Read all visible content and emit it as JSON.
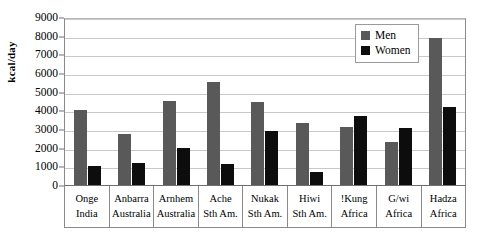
{
  "chart_data": {
    "type": "bar",
    "title": "",
    "xlabel": "",
    "ylabel": "kcal/day",
    "ylim": [
      0,
      9000
    ],
    "yticks": [
      9000,
      8000,
      7000,
      6000,
      5000,
      4000,
      3000,
      2000,
      1000,
      0
    ],
    "grid": true,
    "legend_position": "top-right",
    "categories": [
      "Onge\nIndia",
      "Anbarra\nAustralia",
      "Arnhem\nAustralia",
      "Ache\nSth Am.",
      "Nukak\nSth Am.",
      "Hiwi\nSth Am.",
      "!Kung\nAfrica",
      "G/wi\nAfrica",
      "Hadza\nAfrica"
    ],
    "category_lines": [
      {
        "name": "Onge",
        "region": "India"
      },
      {
        "name": "Anbarra",
        "region": "Australia"
      },
      {
        "name": "Arnhem",
        "region": "Australia"
      },
      {
        "name": "Ache",
        "region": "Sth Am."
      },
      {
        "name": "Nukak",
        "region": "Sth Am."
      },
      {
        "name": "Hiwi",
        "region": "Sth Am."
      },
      {
        "name": "!Kung",
        "region": "Africa"
      },
      {
        "name": "G/wi",
        "region": "Africa"
      },
      {
        "name": "Hadza",
        "region": "Africa"
      }
    ],
    "series": [
      {
        "name": "Men",
        "color": "#595959",
        "values": [
          4000,
          2750,
          4500,
          5500,
          4450,
          3300,
          3100,
          2300,
          7900
        ]
      },
      {
        "name": "Women",
        "color": "#0d0d0d",
        "values": [
          1000,
          1200,
          2000,
          1150,
          2900,
          700,
          3700,
          3050,
          4200
        ]
      }
    ]
  },
  "legend": {
    "items": [
      {
        "label": "Men"
      },
      {
        "label": "Women"
      }
    ]
  }
}
